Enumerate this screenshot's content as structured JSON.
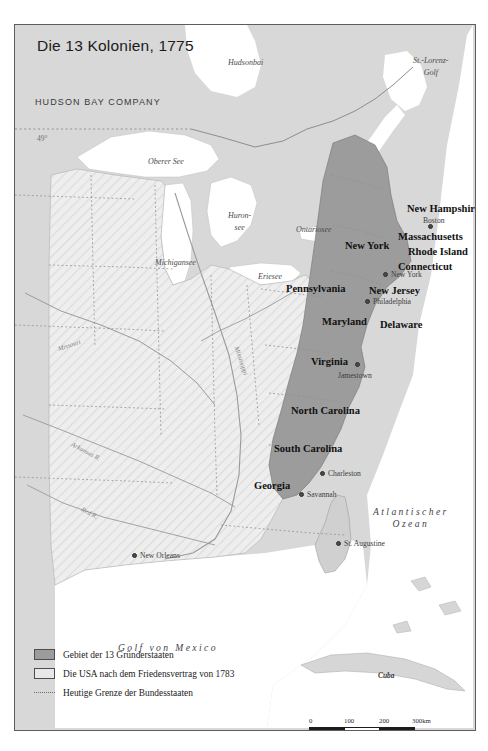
{
  "map": {
    "title": "Die 13 Kolonien, 1775",
    "company_label": "HUDSON BAY COMPANY",
    "latitude_marker": "49°",
    "colors": {
      "founder_states": "#9c9c9c",
      "usa_1783": "#e8e8e8",
      "land_background": "#d8d8d8",
      "water": "#ffffff",
      "frame": "#5d5d5d",
      "state_border": "#6a6a6a"
    },
    "colonies": [
      {
        "name": "New Hampshire",
        "x": 392,
        "y": 178
      },
      {
        "name": "Massachusetts",
        "x": 383,
        "y": 206
      },
      {
        "name": "Rhode Island",
        "x": 393,
        "y": 221
      },
      {
        "name": "Connecticut",
        "x": 383,
        "y": 236
      },
      {
        "name": "New York",
        "x": 330,
        "y": 215
      },
      {
        "name": "New Jersey",
        "x": 354,
        "y": 260
      },
      {
        "name": "Pennsylvania",
        "x": 271,
        "y": 258
      },
      {
        "name": "Maryland",
        "x": 307,
        "y": 291
      },
      {
        "name": "Delaware",
        "x": 365,
        "y": 294
      },
      {
        "name": "Virginia",
        "x": 296,
        "y": 331
      },
      {
        "name": "North Carolina",
        "x": 276,
        "y": 380
      },
      {
        "name": "South Carolina",
        "x": 259,
        "y": 418
      },
      {
        "name": "Georgia",
        "x": 239,
        "y": 455
      }
    ],
    "cities": [
      {
        "name": "Boston",
        "x": 408,
        "y": 191,
        "dot_x": 413,
        "dot_y": 199
      },
      {
        "name": "New York",
        "x": 376,
        "y": 245,
        "dot_x": 368,
        "dot_y": 247
      },
      {
        "name": "Philadelphia",
        "x": 358,
        "y": 272,
        "dot_x": 350,
        "dot_y": 274
      },
      {
        "name": "Jamestown",
        "x": 323,
        "y": 346,
        "dot_x": 340,
        "dot_y": 337
      },
      {
        "name": "Charleston",
        "x": 313,
        "y": 444,
        "dot_x": 305,
        "dot_y": 446
      },
      {
        "name": "Savannah",
        "x": 292,
        "y": 465,
        "dot_x": 284,
        "dot_y": 467
      },
      {
        "name": "St. Augustine",
        "x": 329,
        "y": 514,
        "dot_x": 321,
        "dot_y": 516
      },
      {
        "name": "New Orleans",
        "x": 125,
        "y": 526,
        "dot_x": 117,
        "dot_y": 528
      }
    ],
    "water_labels": [
      {
        "name": "Hudsonbai",
        "x": 213,
        "y": 33,
        "style": "water"
      },
      {
        "name": "St.-Lorenz-\nGolf",
        "x": 398,
        "y": 30,
        "style": "water two"
      },
      {
        "name": "Oberer See",
        "x": 133,
        "y": 132,
        "style": "water"
      },
      {
        "name": "Huron-\nsee",
        "x": 213,
        "y": 185,
        "style": "water two"
      },
      {
        "name": "Michigansee",
        "x": 140,
        "y": 233,
        "style": "water"
      },
      {
        "name": "Eriesee",
        "x": 243,
        "y": 247,
        "style": "water"
      },
      {
        "name": "Ontariosee",
        "x": 281,
        "y": 200,
        "style": "water"
      },
      {
        "name": "Atlantischer\nOzean",
        "x": 358,
        "y": 481,
        "style": "water big two"
      },
      {
        "name": "Golf von Mexico",
        "x": 103,
        "y": 617,
        "style": "water big"
      }
    ],
    "rivers": [
      {
        "name": "Missouri",
        "x": 43,
        "y": 320,
        "rotate": -18
      },
      {
        "name": "Mississippi",
        "x": 222,
        "y": 318,
        "rotate": 72
      },
      {
        "name": "Arkansas R.",
        "x": 57,
        "y": 415,
        "rotate": 28
      },
      {
        "name": "Red R.",
        "x": 67,
        "y": 480,
        "rotate": 28
      }
    ],
    "regions": [
      {
        "name": "Cuba",
        "x": 363,
        "y": 646
      }
    ],
    "legend": {
      "items": [
        {
          "label": "Gebiet der 13 Gründerstaaten",
          "swatch": "founders"
        },
        {
          "label": "Die USA nach dem Friedensvertrag von 1783",
          "swatch": "usa1783"
        },
        {
          "label": "Heutige Grenze der Bundesstaaten",
          "swatch": "dashline"
        }
      ]
    },
    "scale": {
      "ticks": [
        "0",
        "100",
        "200",
        "300km"
      ]
    }
  }
}
